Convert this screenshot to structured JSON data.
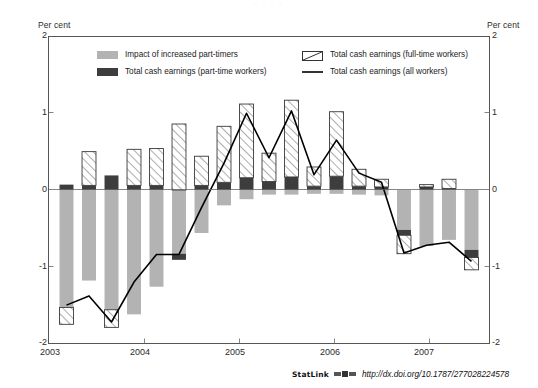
{
  "figure": {
    "top_title_cropped": "· · · ·",
    "unit_label_left": "Per cent",
    "unit_label_right": "Per cent",
    "statlink_label": "StatLink",
    "statlink_icon": "statlink-glyph-icon",
    "statlink_url": "http://dx.doi.org/10.1787/277028224578"
  },
  "legend": {
    "items": [
      {
        "label": "Impact of increased part-timers",
        "swatch": "grey-fill-swatch",
        "color": "#b3b3b3"
      },
      {
        "label": "Total cash earnings (part-time workers)",
        "swatch": "dark-fill-swatch",
        "color": "#3d3d3d"
      },
      {
        "label": "Total cash earnings (full-time workers)",
        "swatch": "hatched-swatch",
        "color": "#ffffff"
      },
      {
        "label": "Total cash earnings (all workers)",
        "swatch": "line-swatch",
        "color": "#000000"
      }
    ]
  },
  "chart_data": {
    "type": "bar",
    "title": "",
    "xlabel": "",
    "ylabel": "Per cent",
    "ylim": [
      -2,
      2
    ],
    "yticks": [
      2,
      1,
      0,
      -1,
      -2
    ],
    "ytick_labels": [
      "2",
      "1",
      "0",
      "-1",
      "-2"
    ],
    "xticks": [
      2003,
      2004,
      2005,
      2006,
      2007
    ],
    "xtick_labels": [
      "2003",
      "2004",
      "2005",
      "2006",
      "2007"
    ],
    "grid": false,
    "legend_position": "inside-top",
    "stacked": true,
    "note": "Quarterly stacked decomposition; grey = impact of increased part-timers, dark = total cash earnings (part-time workers), hatched = total cash earnings (full-time workers); black line = total cash earnings (all workers).",
    "x": [
      "2003Q1",
      "2003Q2",
      "2003Q3",
      "2003Q4",
      "2004Q1",
      "2004Q2",
      "2004Q3",
      "2004Q4",
      "2005Q1",
      "2005Q2",
      "2005Q3",
      "2005Q4",
      "2006Q1",
      "2006Q2",
      "2006Q3",
      "2006Q4",
      "2007Q1",
      "2007Q2",
      "2007Q3"
    ],
    "series": [
      {
        "name": "Impact of increased part-timers",
        "key": "part_timer_impact",
        "color": "#b3b3b3",
        "values": [
          -1.53,
          -1.18,
          -1.56,
          -1.62,
          -1.26,
          -0.83,
          -0.56,
          -0.2,
          -0.12,
          -0.06,
          -0.06,
          -0.05,
          -0.05,
          -0.06,
          -0.07,
          -0.52,
          -0.73,
          -0.65,
          -0.78
        ]
      },
      {
        "name": "Total cash earnings (part-time workers)",
        "key": "part_time_earnings",
        "color": "#3d3d3d",
        "values": [
          0.07,
          0.06,
          0.19,
          0.06,
          0.06,
          -0.08,
          0.06,
          0.1,
          0.16,
          0.11,
          0.17,
          0.05,
          0.18,
          0.05,
          0.04,
          -0.07,
          0.04,
          0.02,
          -0.1
        ]
      },
      {
        "name": "Total cash earnings (full-time workers)",
        "key": "full_time_earnings",
        "color": "#ffffff",
        "hatched": true,
        "values": [
          -0.22,
          0.44,
          -0.23,
          0.47,
          0.48,
          0.86,
          0.38,
          0.73,
          0.96,
          0.37,
          1.0,
          0.25,
          0.84,
          0.22,
          0.1,
          -0.24,
          0.03,
          0.12,
          -0.16
        ]
      }
    ],
    "line_series": {
      "name": "Total cash earnings (all workers)",
      "color": "#000000",
      "values": [
        -1.5,
        -1.38,
        -1.72,
        -1.2,
        -0.84,
        -0.84,
        -0.23,
        0.35,
        1.0,
        0.42,
        1.03,
        0.2,
        0.65,
        0.22,
        0.1,
        -0.82,
        -0.72,
        -0.68,
        -0.93
      ]
    }
  }
}
